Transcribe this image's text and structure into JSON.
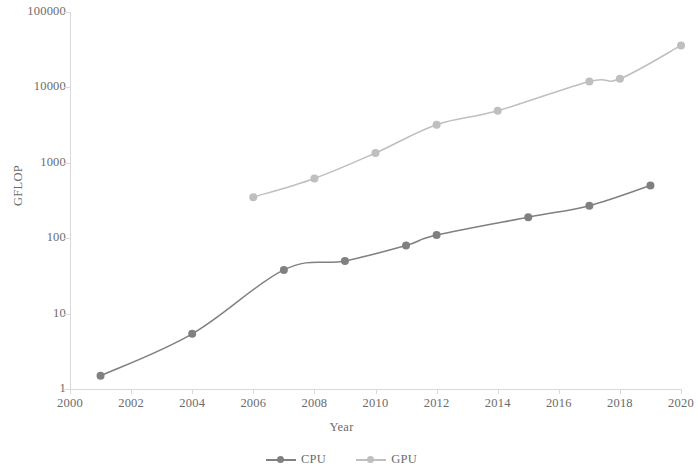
{
  "chart_data": {
    "type": "line",
    "title": "",
    "xlabel": "Year",
    "ylabel": "GFLOP",
    "xlim": [
      2000,
      2020
    ],
    "ylim": [
      1,
      100000
    ],
    "yscale": "log",
    "grid": false,
    "legend_position": "bottom",
    "xticks": [
      "2000",
      "2002",
      "2004",
      "2006",
      "2008",
      "2010",
      "2012",
      "2014",
      "2016",
      "2018",
      "2020"
    ],
    "yticks": [
      "1",
      "10",
      "100",
      "1000",
      "10000",
      "100000"
    ],
    "series": [
      {
        "name": "CPU",
        "color": "#808080",
        "marker": "circle",
        "x": [
          2001,
          2004,
          2007,
          2009,
          2011,
          2012,
          2015,
          2017,
          2019
        ],
        "values": [
          1.5,
          5.4,
          38,
          50,
          80,
          110,
          190,
          270,
          500
        ]
      },
      {
        "name": "GPU",
        "color": "#bfbfbf",
        "marker": "circle",
        "x": [
          2006,
          2008,
          2010,
          2012,
          2014,
          2017,
          2018,
          2020
        ],
        "values": [
          350,
          620,
          1350,
          3200,
          4900,
          12000,
          13000,
          36000
        ]
      }
    ]
  },
  "axes": {
    "y_title": "GFLOP",
    "x_title": "Year"
  },
  "legend": {
    "items": [
      {
        "label": "CPU",
        "color": "#808080"
      },
      {
        "label": "GPU",
        "color": "#bfbfbf"
      }
    ]
  },
  "style": {
    "axis_color": "#d9d9d9",
    "text_color": "#6b6b6b",
    "background": "#ffffff"
  }
}
